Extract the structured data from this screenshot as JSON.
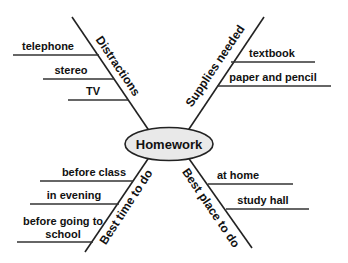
{
  "center": {
    "label": "Homework"
  },
  "branches": [
    {
      "label": "Distractions",
      "items": [
        "telephone",
        "stereo",
        "TV"
      ]
    },
    {
      "label": "Supplies needed",
      "items": [
        "textbook",
        "paper and pencil"
      ]
    },
    {
      "label": "Best time to do",
      "items": [
        "before class",
        "in evening",
        "before going to school"
      ]
    },
    {
      "label": "Best place to do",
      "items": [
        "at home",
        "study hall"
      ]
    }
  ],
  "colors": {
    "node_fill": "#e9e9e9",
    "node_stroke": "#222222",
    "branch_line": "#222222",
    "item_line": "#333333",
    "text": "#111111"
  }
}
